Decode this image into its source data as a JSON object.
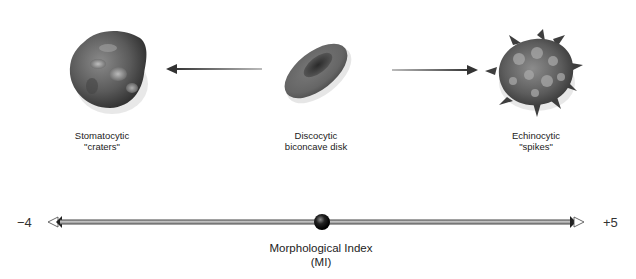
{
  "diagram": {
    "cells": [
      {
        "id": "stomatocyte",
        "name": "Stomatocytic",
        "descriptor": "\"craters\"",
        "position": "left"
      },
      {
        "id": "discocyte",
        "name": "Discocytic",
        "descriptor": "biconcave disk",
        "position": "center"
      },
      {
        "id": "echinocyte",
        "name": "Echinocytic",
        "descriptor": "\"spikes\"",
        "position": "right"
      }
    ],
    "arrows": [
      {
        "from": "discocyte",
        "to": "stomatocyte",
        "direction": "left"
      },
      {
        "from": "discocyte",
        "to": "echinocyte",
        "direction": "right"
      }
    ],
    "scale": {
      "min_label": "−4",
      "max_label": "+5",
      "min": -4,
      "max": 5,
      "marker_position": "center",
      "title_line1": "Morphological Index",
      "title_line2": "(MI)"
    },
    "colors": {
      "cell_fill": "#6a6a6a",
      "cell_dark": "#3a3a3a",
      "axis": "#555555",
      "background": "#ffffff"
    }
  }
}
